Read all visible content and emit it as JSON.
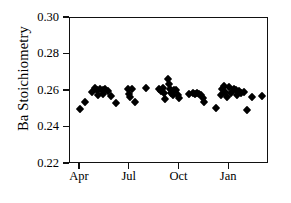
{
  "chart_data": {
    "type": "scatter",
    "title": "",
    "xlabel": "",
    "ylabel": "Ba Stoichiometry",
    "ylim": [
      0.22,
      0.3
    ],
    "yticks": [
      0.22,
      0.24,
      0.26,
      0.28,
      0.3
    ],
    "ytick_labels": [
      "0.22",
      "0.24",
      "0.26",
      "0.28",
      "0.30"
    ],
    "xtick_labels": [
      "Apr",
      "Jul",
      "Oct",
      "Jan"
    ],
    "xtick_months": [
      0,
      3,
      6,
      9
    ],
    "xlim_months": [
      -0.6,
      11.4
    ],
    "grid": false,
    "legend": null,
    "marker_style": "filled-diamond",
    "marker_color": "#000000",
    "series": [
      {
        "name": "Ba Stoichiometry",
        "points": [
          {
            "x": 0.05,
            "y": 0.2497
          },
          {
            "x": 0.35,
            "y": 0.2537
          },
          {
            "x": 0.8,
            "y": 0.2588
          },
          {
            "x": 0.95,
            "y": 0.2612
          },
          {
            "x": 1.1,
            "y": 0.26
          },
          {
            "x": 1.12,
            "y": 0.2572
          },
          {
            "x": 1.28,
            "y": 0.2607
          },
          {
            "x": 1.42,
            "y": 0.2601
          },
          {
            "x": 1.45,
            "y": 0.2578
          },
          {
            "x": 1.6,
            "y": 0.2604
          },
          {
            "x": 1.78,
            "y": 0.2596
          },
          {
            "x": 1.95,
            "y": 0.2566
          },
          {
            "x": 2.25,
            "y": 0.2531
          },
          {
            "x": 2.95,
            "y": 0.2604
          },
          {
            "x": 3.02,
            "y": 0.258
          },
          {
            "x": 3.08,
            "y": 0.2562
          },
          {
            "x": 3.22,
            "y": 0.2603
          },
          {
            "x": 3.38,
            "y": 0.2533
          },
          {
            "x": 4.05,
            "y": 0.2613
          },
          {
            "x": 4.82,
            "y": 0.2604
          },
          {
            "x": 4.95,
            "y": 0.2592
          },
          {
            "x": 5.05,
            "y": 0.2612
          },
          {
            "x": 5.12,
            "y": 0.2584
          },
          {
            "x": 5.18,
            "y": 0.2552
          },
          {
            "x": 5.35,
            "y": 0.2661
          },
          {
            "x": 5.42,
            "y": 0.2631
          },
          {
            "x": 5.52,
            "y": 0.2606
          },
          {
            "x": 5.58,
            "y": 0.2584
          },
          {
            "x": 5.65,
            "y": 0.257
          },
          {
            "x": 5.72,
            "y": 0.2602
          },
          {
            "x": 5.88,
            "y": 0.2598
          },
          {
            "x": 5.95,
            "y": 0.2572
          },
          {
            "x": 6.05,
            "y": 0.2556
          },
          {
            "x": 6.62,
            "y": 0.2578
          },
          {
            "x": 6.85,
            "y": 0.2583
          },
          {
            "x": 7.02,
            "y": 0.2579
          },
          {
            "x": 7.12,
            "y": 0.2583
          },
          {
            "x": 7.22,
            "y": 0.2577
          },
          {
            "x": 7.35,
            "y": 0.2575
          },
          {
            "x": 7.48,
            "y": 0.2555
          },
          {
            "x": 7.55,
            "y": 0.2535
          },
          {
            "x": 8.25,
            "y": 0.2502
          },
          {
            "x": 8.55,
            "y": 0.257
          },
          {
            "x": 8.62,
            "y": 0.2608
          },
          {
            "x": 8.72,
            "y": 0.2622
          },
          {
            "x": 8.82,
            "y": 0.2588
          },
          {
            "x": 8.92,
            "y": 0.2562
          },
          {
            "x": 9.05,
            "y": 0.2615
          },
          {
            "x": 9.18,
            "y": 0.2585
          },
          {
            "x": 9.35,
            "y": 0.2605
          },
          {
            "x": 9.48,
            "y": 0.2598
          },
          {
            "x": 9.55,
            "y": 0.2572
          },
          {
            "x": 9.68,
            "y": 0.2594
          },
          {
            "x": 9.78,
            "y": 0.2583
          },
          {
            "x": 9.95,
            "y": 0.259
          },
          {
            "x": 10.15,
            "y": 0.2491
          },
          {
            "x": 10.42,
            "y": 0.256
          },
          {
            "x": 11.05,
            "y": 0.2568
          }
        ]
      }
    ]
  }
}
